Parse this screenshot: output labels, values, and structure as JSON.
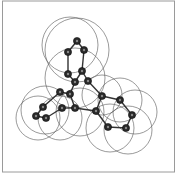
{
  "figure": {
    "type": "molecular-model",
    "colors": {
      "frame": "#9a9a9a",
      "sphere_stroke": "#555555",
      "atom_fill": "#2a2a2a",
      "bond": "#333333"
    },
    "spheres": [
      {
        "cx": 77,
        "cy": 50,
        "r": 32
      },
      {
        "cx": 70,
        "cy": 45,
        "r": 28
      },
      {
        "cx": 75,
        "cy": 78,
        "r": 30
      },
      {
        "cx": 45,
        "cy": 110,
        "r": 24
      },
      {
        "cx": 38,
        "cy": 118,
        "r": 22
      },
      {
        "cx": 60,
        "cy": 118,
        "r": 22
      },
      {
        "cx": 80,
        "cy": 112,
        "r": 24
      },
      {
        "cx": 120,
        "cy": 100,
        "r": 22
      },
      {
        "cx": 135,
        "cy": 112,
        "r": 22
      },
      {
        "cx": 110,
        "cy": 128,
        "r": 24
      },
      {
        "cx": 128,
        "cy": 130,
        "r": 24
      },
      {
        "cx": 102,
        "cy": 95,
        "r": 20
      }
    ],
    "atoms": [
      {
        "x": 77,
        "y": 41
      },
      {
        "x": 68,
        "y": 52
      },
      {
        "x": 84,
        "y": 50
      },
      {
        "x": 68,
        "y": 74
      },
      {
        "x": 82,
        "y": 71
      },
      {
        "x": 75,
        "y": 82
      },
      {
        "x": 88,
        "y": 81
      },
      {
        "x": 60,
        "y": 92
      },
      {
        "x": 70,
        "y": 94
      },
      {
        "x": 43,
        "y": 107
      },
      {
        "x": 62,
        "y": 108
      },
      {
        "x": 75,
        "y": 108
      },
      {
        "x": 36,
        "y": 116
      },
      {
        "x": 46,
        "y": 118
      },
      {
        "x": 102,
        "y": 96
      },
      {
        "x": 120,
        "y": 100
      },
      {
        "x": 96,
        "y": 111
      },
      {
        "x": 132,
        "y": 115
      },
      {
        "x": 108,
        "y": 127
      },
      {
        "x": 126,
        "y": 128
      }
    ],
    "bonds": [
      [
        0,
        1
      ],
      [
        0,
        2
      ],
      [
        1,
        3
      ],
      [
        2,
        4
      ],
      [
        3,
        5
      ],
      [
        4,
        5
      ],
      [
        4,
        6
      ],
      [
        5,
        8
      ],
      [
        7,
        8
      ],
      [
        7,
        9
      ],
      [
        8,
        11
      ],
      [
        9,
        12
      ],
      [
        12,
        13
      ],
      [
        13,
        10
      ],
      [
        10,
        11
      ],
      [
        11,
        16
      ],
      [
        6,
        14
      ],
      [
        14,
        15
      ],
      [
        14,
        16
      ],
      [
        15,
        17
      ],
      [
        17,
        19
      ],
      [
        19,
        18
      ],
      [
        18,
        16
      ]
    ]
  }
}
